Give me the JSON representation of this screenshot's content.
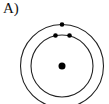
{
  "diagram": {
    "label": "A)",
    "type": "bohr-model",
    "nucleus": {
      "cx": 62,
      "cy": 66,
      "r": 3.5
    },
    "shells": [
      {
        "name": "inner-shell",
        "r": 31,
        "electrons": [
          {
            "cx": 55.5,
            "cy": 35.5
          },
          {
            "cx": 69.5,
            "cy": 35.5
          }
        ]
      },
      {
        "name": "outer-shell",
        "r": 41.5,
        "electrons": [
          {
            "cx": 62,
            "cy": 24.5
          }
        ]
      }
    ],
    "colors": {
      "stroke": "#222222",
      "fill": "#000000"
    }
  }
}
